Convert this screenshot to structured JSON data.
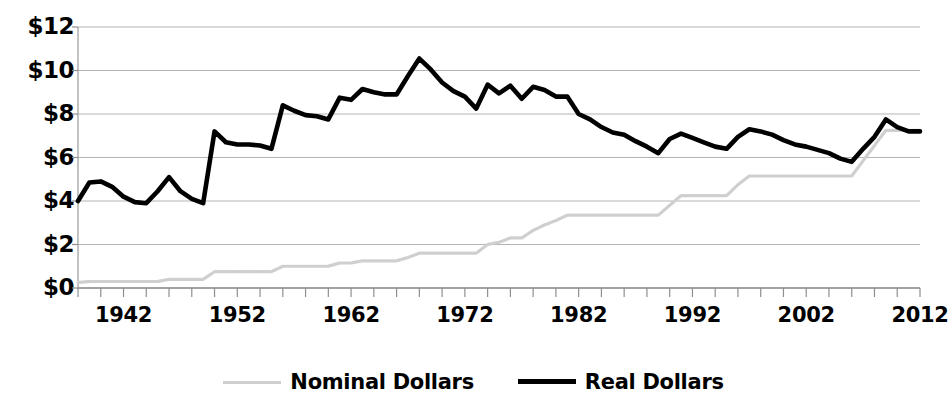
{
  "chart_data": {
    "type": "line",
    "title": "",
    "subtitle": "",
    "xlabel": "",
    "ylabel": "",
    "xlim": [
      1938,
      2012
    ],
    "ylim": [
      0,
      12
    ],
    "ytick_step": 2,
    "grid": true,
    "legend_position": "bottom",
    "ytick_labels": [
      "$12",
      "$10",
      "$8",
      "$6",
      "$4",
      "$2",
      "$0"
    ],
    "ytick_values": [
      12,
      10,
      8,
      6,
      4,
      2,
      0
    ],
    "xtick_labels": [
      "1942",
      "1952",
      "1962",
      "1972",
      "1982",
      "1992",
      "2002",
      "2012"
    ],
    "xtick_values": [
      1942,
      1952,
      1962,
      1972,
      1982,
      1992,
      2002,
      2012
    ],
    "minor_tick_step_years": 2,
    "x": [
      1938,
      1939,
      1940,
      1941,
      1942,
      1943,
      1944,
      1945,
      1946,
      1947,
      1948,
      1949,
      1950,
      1951,
      1952,
      1953,
      1954,
      1955,
      1956,
      1957,
      1958,
      1959,
      1960,
      1961,
      1962,
      1963,
      1964,
      1965,
      1966,
      1967,
      1968,
      1969,
      1970,
      1971,
      1972,
      1973,
      1974,
      1975,
      1976,
      1977,
      1978,
      1979,
      1980,
      1981,
      1982,
      1983,
      1984,
      1985,
      1986,
      1987,
      1988,
      1989,
      1990,
      1991,
      1992,
      1993,
      1994,
      1995,
      1996,
      1997,
      1998,
      1999,
      2000,
      2001,
      2002,
      2003,
      2004,
      2005,
      2006,
      2007,
      2008,
      2009,
      2010,
      2011,
      2012
    ],
    "series": [
      {
        "name": "Nominal Dollars",
        "color": "#cfcfcf",
        "style": "thin-dotted",
        "values": [
          0.25,
          0.3,
          0.3,
          0.3,
          0.3,
          0.3,
          0.3,
          0.3,
          0.4,
          0.4,
          0.4,
          0.4,
          0.75,
          0.75,
          0.75,
          0.75,
          0.75,
          0.75,
          1.0,
          1.0,
          1.0,
          1.0,
          1.0,
          1.15,
          1.15,
          1.25,
          1.25,
          1.25,
          1.25,
          1.4,
          1.6,
          1.6,
          1.6,
          1.6,
          1.6,
          1.6,
          2.0,
          2.1,
          2.3,
          2.3,
          2.65,
          2.9,
          3.1,
          3.35,
          3.35,
          3.35,
          3.35,
          3.35,
          3.35,
          3.35,
          3.35,
          3.35,
          3.8,
          4.25,
          4.25,
          4.25,
          4.25,
          4.25,
          4.75,
          5.15,
          5.15,
          5.15,
          5.15,
          5.15,
          5.15,
          5.15,
          5.15,
          5.15,
          5.15,
          5.85,
          6.55,
          7.25,
          7.25,
          7.25,
          7.25
        ]
      },
      {
        "name": "Real Dollars",
        "color": "#000000",
        "style": "thick-solid",
        "values": [
          4.0,
          4.85,
          4.9,
          4.65,
          4.2,
          3.95,
          3.9,
          4.45,
          5.1,
          4.45,
          4.1,
          3.9,
          7.2,
          6.7,
          6.6,
          6.6,
          6.55,
          6.4,
          8.4,
          8.15,
          7.95,
          7.9,
          7.75,
          8.75,
          8.65,
          9.15,
          9.0,
          8.9,
          8.9,
          9.75,
          10.55,
          10.05,
          9.45,
          9.05,
          8.8,
          8.25,
          9.35,
          8.95,
          9.3,
          8.7,
          9.25,
          9.1,
          8.8,
          8.8,
          8.0,
          7.75,
          7.4,
          7.15,
          7.05,
          6.75,
          6.5,
          6.2,
          6.85,
          7.1,
          6.9,
          6.7,
          6.5,
          6.4,
          6.95,
          7.3,
          7.2,
          7.05,
          6.8,
          6.6,
          6.5,
          6.35,
          6.2,
          5.95,
          5.8,
          6.4,
          6.95,
          7.75,
          7.4,
          7.2,
          7.2
        ]
      }
    ]
  }
}
